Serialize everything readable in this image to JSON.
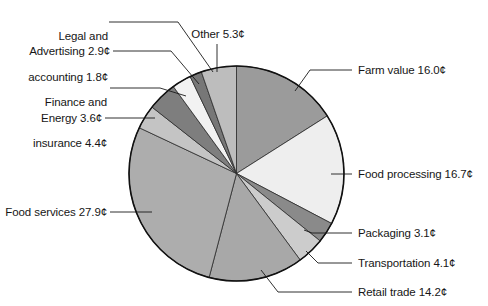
{
  "figure": {
    "type": "pie-chart-figure",
    "background_color": "#ffffff",
    "outline_color": "#1a1a1a"
  },
  "chart_data": {
    "type": "pie",
    "title": "",
    "subtitle": "",
    "xlabel": "",
    "ylabel": "",
    "unit": "¢",
    "total": 100.0,
    "legend_position": "callout-labels",
    "grid": false,
    "start_angle_deg": 0,
    "direction": "clockwise",
    "categories": [
      "Farm value",
      "Food processing",
      "Packaging",
      "Transportation",
      "Retail trade",
      "Food services",
      "Energy",
      "Finance and insurance",
      "Advertising",
      "Legal and accounting",
      "Other"
    ],
    "values": [
      16.0,
      16.7,
      3.1,
      4.1,
      14.2,
      27.9,
      3.6,
      4.4,
      2.9,
      1.8,
      5.3
    ],
    "slices": [
      {
        "name": "Farm value",
        "value": 16.0,
        "label": "Farm value 16.0¢",
        "color": "#9b9b9b"
      },
      {
        "name": "Food processing",
        "value": 16.7,
        "label": "Food processing 16.7¢",
        "color": "#eeeeee"
      },
      {
        "name": "Packaging",
        "value": 3.1,
        "label": "Packaging 3.1¢",
        "color": "#8a8a8a"
      },
      {
        "name": "Transportation",
        "value": 4.1,
        "label": "Transportation 4.1¢",
        "color": "#cccccc"
      },
      {
        "name": "Retail trade",
        "value": 14.2,
        "label": "Retail trade 14.2¢",
        "color": "#a8a8a8"
      },
      {
        "name": "Food services",
        "value": 27.9,
        "label": "Food services 27.9¢",
        "color": "#adadad"
      },
      {
        "name": "Energy",
        "value": 3.6,
        "label": "Energy 3.6¢",
        "color": "#c4c4c4"
      },
      {
        "name": "Finance and insurance",
        "value": 4.4,
        "label": "Finance and\ninsurance 4.4¢",
        "color": "#7e7e7e"
      },
      {
        "name": "Advertising",
        "value": 2.9,
        "label": "Advertising 2.9¢",
        "color": "#f2f2f2"
      },
      {
        "name": "Legal and accounting",
        "value": 1.8,
        "label": "Legal and\naccounting 1.8¢",
        "color": "#777777"
      },
      {
        "name": "Other",
        "value": 5.3,
        "label": "Other 5.3¢",
        "color": "#bdbdbd"
      }
    ]
  },
  "labels": {
    "legal_and_accounting": {
      "line1": "Legal and",
      "line2": "accounting 1.8¢"
    },
    "advertising": {
      "text": "Advertising 2.9¢"
    },
    "finance_and_insurance": {
      "line1": "Finance and",
      "line2": "insurance 4.4¢"
    },
    "energy": {
      "text": "Energy 3.6¢"
    },
    "food_services": {
      "text": "Food services 27.9¢"
    },
    "other": {
      "text": "Other 5.3¢"
    },
    "farm_value": {
      "text": "Farm value 16.0¢"
    },
    "food_processing": {
      "text": "Food processing 16.7¢"
    },
    "packaging": {
      "text": "Packaging 3.1¢"
    },
    "transportation": {
      "text": "Transportation 4.1¢"
    },
    "retail_trade": {
      "text": "Retail trade 14.2¢"
    }
  }
}
